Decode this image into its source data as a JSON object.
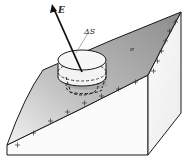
{
  "figure": {
    "labels": {
      "field": "E",
      "area": "ΔS",
      "charge_density": "σ"
    },
    "surface_charges": "+",
    "colors": {
      "surface_shade_dark": "#8a8a8a",
      "surface_shade_light": "#e6e6e6",
      "block_face": "#f4f4f4",
      "outline": "#1a1a1a"
    }
  }
}
